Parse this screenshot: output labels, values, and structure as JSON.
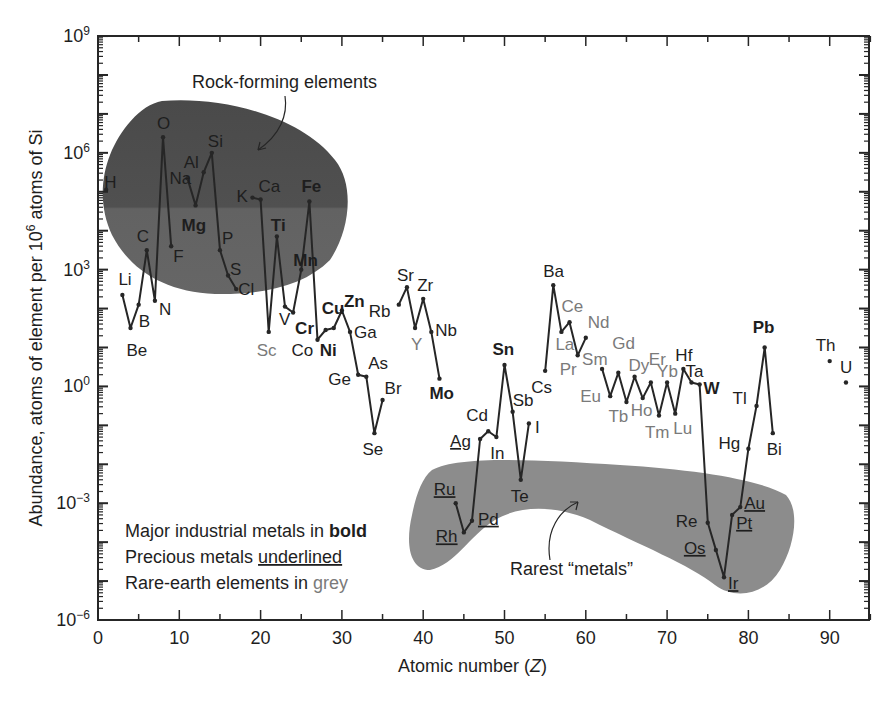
{
  "chart_data": {
    "type": "line",
    "title": "",
    "xlabel": "Atomic number (Z)",
    "ylabel": "Abundance, atoms of element per 10^6 atoms of Si",
    "xlim": [
      0,
      95
    ],
    "ylim_log10": [
      -6,
      9
    ],
    "yscale": "log",
    "grid": false,
    "x_ticks": [
      0,
      10,
      20,
      30,
      40,
      50,
      60,
      70,
      80,
      90
    ],
    "y_ticks": [
      "10^9",
      "10^6",
      "10^3",
      "10^0",
      "10^-3",
      "10^-6"
    ],
    "y_ticks_log10": [
      9,
      6,
      3,
      0,
      -3,
      -6
    ],
    "points": [
      {
        "el": "H",
        "z": 1,
        "log10": 5.05,
        "style": "normal",
        "lx": -2,
        "ly": -2
      },
      {
        "el": "Li",
        "z": 3,
        "log10": 2.35,
        "style": "normal",
        "lx": -4,
        "ly": -10
      },
      {
        "el": "Be",
        "z": 4,
        "log10": 1.5,
        "style": "normal",
        "lx": -4,
        "ly": 28
      },
      {
        "el": "B",
        "z": 5,
        "log10": 2.1,
        "style": "normal",
        "lx": 0,
        "ly": 22
      },
      {
        "el": "C",
        "z": 6,
        "log10": 3.5,
        "style": "normal",
        "lx": -10,
        "ly": -8
      },
      {
        "el": "N",
        "z": 7,
        "log10": 2.2,
        "style": "normal",
        "lx": 4,
        "ly": 14
      },
      {
        "el": "O",
        "z": 8,
        "log10": 6.4,
        "style": "normal",
        "lx": -6,
        "ly": -8
      },
      {
        "el": "F",
        "z": 9,
        "log10": 3.6,
        "style": "normal",
        "lx": 2,
        "ly": 16
      },
      {
        "el": "Na",
        "z": 11,
        "log10": 5.35,
        "style": "normal",
        "lx": -18,
        "ly": 6
      },
      {
        "el": "Mg",
        "z": 12,
        "log10": 4.65,
        "style": "bold",
        "lx": -14,
        "ly": 26
      },
      {
        "el": "Al",
        "z": 13,
        "log10": 5.5,
        "style": "normal",
        "lx": -20,
        "ly": -4
      },
      {
        "el": "Si",
        "z": 14,
        "log10": 6.0,
        "style": "normal",
        "lx": -4,
        "ly": -6
      },
      {
        "el": "P",
        "z": 15,
        "log10": 3.5,
        "style": "normal",
        "lx": 2,
        "ly": -6
      },
      {
        "el": "S",
        "z": 16,
        "log10": 2.85,
        "style": "normal",
        "lx": 2,
        "ly": 0
      },
      {
        "el": "Cl",
        "z": 17,
        "log10": 2.5,
        "style": "normal",
        "lx": 2,
        "ly": 6
      },
      {
        "el": "K",
        "z": 19,
        "log10": 4.85,
        "style": "normal",
        "lx": -16,
        "ly": 4
      },
      {
        "el": "Ca",
        "z": 20,
        "log10": 4.8,
        "style": "normal",
        "lx": -2,
        "ly": -8
      },
      {
        "el": "Sc",
        "z": 21,
        "log10": 1.4,
        "style": "grey",
        "lx": -12,
        "ly": 24
      },
      {
        "el": "Ti",
        "z": 22,
        "log10": 3.85,
        "style": "bold",
        "lx": -6,
        "ly": -6
      },
      {
        "el": "V",
        "z": 23,
        "log10": 2.05,
        "style": "normal",
        "lx": -6,
        "ly": 18
      },
      {
        "el": "Cr",
        "z": 24,
        "log10": 1.9,
        "style": "bold",
        "lx": 2,
        "ly": 22
      },
      {
        "el": "Mn",
        "z": 25,
        "log10": 3.0,
        "style": "bold",
        "lx": -8,
        "ly": -4
      },
      {
        "el": "Fe",
        "z": 26,
        "log10": 4.75,
        "style": "bold",
        "lx": -8,
        "ly": -10
      },
      {
        "el": "Co",
        "z": 27,
        "log10": 1.2,
        "style": "normal",
        "lx": -26,
        "ly": 16
      },
      {
        "el": "Ni",
        "z": 28,
        "log10": 1.45,
        "style": "bold",
        "lx": -6,
        "ly": 26
      },
      {
        "el": "Cu",
        "z": 29,
        "log10": 1.5,
        "style": "bold",
        "lx": -12,
        "ly": -14
      },
      {
        "el": "Zn",
        "z": 30,
        "log10": 1.95,
        "style": "bold",
        "lx": 2,
        "ly": -4
      },
      {
        "el": "Ga",
        "z": 31,
        "log10": 1.4,
        "style": "normal",
        "lx": 4,
        "ly": 6
      },
      {
        "el": "Ge",
        "z": 32,
        "log10": 0.3,
        "style": "normal",
        "lx": -30,
        "ly": 10
      },
      {
        "el": "As",
        "z": 33,
        "log10": 0.25,
        "style": "normal",
        "lx": 2,
        "ly": -8
      },
      {
        "el": "Se",
        "z": 34,
        "log10": -1.2,
        "style": "normal",
        "lx": -12,
        "ly": 22
      },
      {
        "el": "Br",
        "z": 35,
        "log10": -0.35,
        "style": "normal",
        "lx": 2,
        "ly": -6
      },
      {
        "el": "Rb",
        "z": 37,
        "log10": 2.1,
        "style": "normal",
        "lx": -30,
        "ly": 12
      },
      {
        "el": "Sr",
        "z": 38,
        "log10": 2.55,
        "style": "normal",
        "lx": -10,
        "ly": -6
      },
      {
        "el": "Y",
        "z": 39,
        "log10": 1.5,
        "style": "grey",
        "lx": -4,
        "ly": 22
      },
      {
        "el": "Zr",
        "z": 40,
        "log10": 2.25,
        "style": "normal",
        "lx": -6,
        "ly": -8
      },
      {
        "el": "Nb",
        "z": 41,
        "log10": 1.4,
        "style": "normal",
        "lx": 4,
        "ly": 4
      },
      {
        "el": "Mo",
        "z": 42,
        "log10": 0.2,
        "style": "bold",
        "lx": -10,
        "ly": 20
      },
      {
        "el": "Ru",
        "z": 44,
        "log10": -3.0,
        "style": "precious",
        "lx": -22,
        "ly": -8
      },
      {
        "el": "Rh",
        "z": 45,
        "log10": -3.75,
        "style": "precious",
        "lx": -28,
        "ly": 10
      },
      {
        "el": "Pd",
        "z": 46,
        "log10": -3.45,
        "style": "precious",
        "lx": 6,
        "ly": 4
      },
      {
        "el": "Ag",
        "z": 47,
        "log10": -1.35,
        "style": "precious",
        "lx": -30,
        "ly": 8
      },
      {
        "el": "Cd",
        "z": 48,
        "log10": -1.15,
        "style": "normal",
        "lx": -22,
        "ly": -10
      },
      {
        "el": "In",
        "z": 49,
        "log10": -1.3,
        "style": "normal",
        "lx": -6,
        "ly": 22
      },
      {
        "el": "Sn",
        "z": 50,
        "log10": 0.55,
        "style": "bold",
        "lx": -12,
        "ly": -10
      },
      {
        "el": "Sb",
        "z": 51,
        "log10": -0.65,
        "style": "normal",
        "lx": 0,
        "ly": -6
      },
      {
        "el": "Te",
        "z": 52,
        "log10": -2.4,
        "style": "normal",
        "lx": -10,
        "ly": 22
      },
      {
        "el": "I",
        "z": 53,
        "log10": -0.95,
        "style": "normal",
        "lx": 6,
        "ly": 10
      },
      {
        "el": "Cs",
        "z": 55,
        "log10": 0.4,
        "style": "normal",
        "lx": -14,
        "ly": 22
      },
      {
        "el": "Ba",
        "z": 56,
        "log10": 2.6,
        "style": "normal",
        "lx": -10,
        "ly": -8
      },
      {
        "el": "La",
        "z": 57,
        "log10": 1.4,
        "style": "grey",
        "lx": -6,
        "ly": 18
      },
      {
        "el": "Ce",
        "z": 58,
        "log10": 1.65,
        "style": "grey",
        "lx": -8,
        "ly": -10
      },
      {
        "el": "Pr",
        "z": 59,
        "log10": 0.8,
        "style": "grey",
        "lx": -18,
        "ly": 20
      },
      {
        "el": "Nd",
        "z": 60,
        "log10": 1.25,
        "style": "grey",
        "lx": 2,
        "ly": -10
      },
      {
        "el": "Sm",
        "z": 62,
        "log10": 0.45,
        "style": "grey",
        "lx": -20,
        "ly": -4
      },
      {
        "el": "Eu",
        "z": 63,
        "log10": -0.25,
        "style": "grey",
        "lx": -30,
        "ly": 6
      },
      {
        "el": "Gd",
        "z": 64,
        "log10": 0.35,
        "style": "grey",
        "lx": -6,
        "ly": -24
      },
      {
        "el": "Tb",
        "z": 65,
        "log10": -0.4,
        "style": "grey",
        "lx": -18,
        "ly": 20
      },
      {
        "el": "Dy",
        "z": 66,
        "log10": 0.25,
        "style": "grey",
        "lx": -6,
        "ly": -6
      },
      {
        "el": "Ho",
        "z": 67,
        "log10": -0.3,
        "style": "grey",
        "lx": -12,
        "ly": 18
      },
      {
        "el": "Er",
        "z": 68,
        "log10": 0.1,
        "style": "grey",
        "lx": -2,
        "ly": -18
      },
      {
        "el": "Tm",
        "z": 69,
        "log10": -0.75,
        "style": "grey",
        "lx": -14,
        "ly": 22
      },
      {
        "el": "Yb",
        "z": 70,
        "log10": 0.1,
        "style": "grey",
        "lx": -10,
        "ly": -6
      },
      {
        "el": "Lu",
        "z": 71,
        "log10": -0.7,
        "style": "grey",
        "lx": -2,
        "ly": 20
      },
      {
        "el": "Hf",
        "z": 72,
        "log10": 0.45,
        "style": "normal",
        "lx": -8,
        "ly": -8
      },
      {
        "el": "Ta",
        "z": 73,
        "log10": 0.1,
        "style": "normal",
        "lx": -6,
        "ly": -6
      },
      {
        "el": "W",
        "z": 74,
        "log10": 0.05,
        "style": "bold",
        "lx": 4,
        "ly": 10
      },
      {
        "el": "Re",
        "z": 75,
        "log10": -3.5,
        "style": "normal",
        "lx": -32,
        "ly": 4
      },
      {
        "el": "Os",
        "z": 76,
        "log10": -4.2,
        "style": "precious",
        "lx": -32,
        "ly": 4
      },
      {
        "el": "Ir",
        "z": 77,
        "log10": -4.9,
        "style": "precious",
        "lx": 4,
        "ly": 12
      },
      {
        "el": "Pt",
        "z": 78,
        "log10": -3.3,
        "style": "precious",
        "lx": 4,
        "ly": 14
      },
      {
        "el": "Au",
        "z": 79,
        "log10": -3.1,
        "style": "precious",
        "lx": 4,
        "ly": 2
      },
      {
        "el": "Hg",
        "z": 80,
        "log10": -1.6,
        "style": "normal",
        "lx": -30,
        "ly": 0
      },
      {
        "el": "Tl",
        "z": 81,
        "log10": -0.5,
        "style": "normal",
        "lx": -24,
        "ly": -2
      },
      {
        "el": "Pb",
        "z": 82,
        "log10": 1.0,
        "style": "bold",
        "lx": -12,
        "ly": -14
      },
      {
        "el": "Bi",
        "z": 83,
        "log10": -1.2,
        "style": "normal",
        "lx": -6,
        "ly": 22
      },
      {
        "el": "Th",
        "z": 90,
        "log10": 0.65,
        "style": "normal",
        "lx": -14,
        "ly": -10
      },
      {
        "el": "U",
        "z": 92,
        "log10": 0.1,
        "style": "normal",
        "lx": -6,
        "ly": -10
      }
    ],
    "line_segments": [
      [
        1
      ],
      [
        3,
        4,
        5,
        6,
        7,
        8,
        9
      ],
      [
        11,
        12,
        13,
        14,
        15,
        16,
        17
      ],
      [
        19,
        20,
        21,
        22,
        23,
        24,
        25,
        26,
        27,
        28,
        29,
        30,
        31,
        32,
        33,
        34,
        35
      ],
      [
        37,
        38,
        39,
        40,
        41,
        42
      ],
      [
        44,
        45,
        46,
        47,
        48,
        49,
        50,
        51,
        52,
        53
      ],
      [
        55,
        56,
        57,
        58,
        59,
        60
      ],
      [
        62,
        63,
        64,
        65,
        66,
        67,
        68,
        69,
        70,
        71,
        72,
        73,
        74,
        75,
        76,
        77,
        78,
        79,
        80,
        81,
        82,
        83
      ],
      [
        90
      ],
      [
        92
      ]
    ],
    "annotations": [
      {
        "text": "Rock-forming elements",
        "region": "rock-forming"
      },
      {
        "text": "Rarest “metals”",
        "region": "rarest-metals"
      }
    ],
    "legend": [
      {
        "prefix": "Major industrial metals in ",
        "emph": "bold",
        "type": "bold"
      },
      {
        "prefix": "Precious metals ",
        "emph": "underlined",
        "type": "underline"
      },
      {
        "prefix": "Rare-earth elements in ",
        "emph": "grey",
        "type": "grey"
      }
    ]
  },
  "labels": {
    "xlabel_prefix": "Atomic number (",
    "xlabel_var": "Z",
    "xlabel_suffix": ")",
    "ylabel_main": "Abundance, atoms of element per 10",
    "ylabel_sup": "6",
    "ylabel_tail": " atoms of Si",
    "rock_forming": "Rock-forming elements",
    "rarest_metals": "Rarest “metals”",
    "legend_bold_prefix": "Major industrial metals in ",
    "legend_bold_emph": "bold",
    "legend_under_prefix": "Precious metals ",
    "legend_under_emph": "underlined",
    "legend_grey_prefix": "Rare-earth elements in ",
    "legend_grey_emph": "grey"
  },
  "colors": {
    "rock_region": "#5a5a5a",
    "rock_region_upper": "#4d4d4d",
    "rare_region": "#8c8c8c",
    "line": "#262626",
    "grey_label": "#7a7a7a",
    "text": "#1e1e1e"
  }
}
